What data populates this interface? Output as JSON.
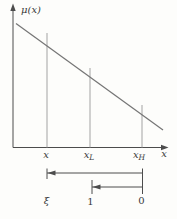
{
  "figure": {
    "y_axis_label": "μ(x)",
    "x_axis_label": "x",
    "x_ticks": [
      {
        "base": "x",
        "sub": ""
      },
      {
        "base": "x",
        "sub": "L"
      },
      {
        "base": "x",
        "sub": "H"
      }
    ],
    "scale": {
      "left_label": "ξ",
      "mid_label": "1",
      "right_label": "0"
    }
  },
  "colors": {
    "background": "#fdfdfb",
    "axis": "#4c4c4c",
    "curve": "#757575",
    "guide_line": "#a3a3a3",
    "text": "#3a3a3a"
  }
}
